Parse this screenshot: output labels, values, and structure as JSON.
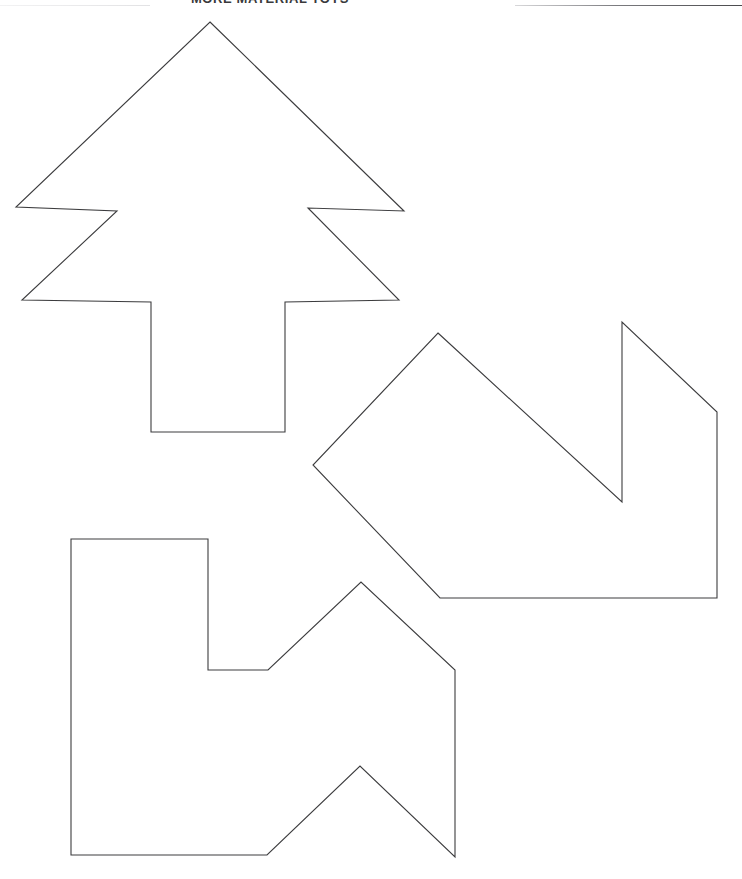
{
  "page": {
    "width": 742,
    "height": 879,
    "background_color": "#ffffff",
    "document_type": "printable cut-out shape templates worksheet"
  },
  "header": {
    "title": "MORE MATERIAL TOYS",
    "title_color": "#3a3a3c",
    "rule_color": "#4a4a4d",
    "clipped": "top of heading cut off by page crop"
  },
  "drawing": {
    "stroke_color": "#3c3c3e",
    "fill_color": "#ffffff",
    "stroke_width": 1.1,
    "shape_count": 3,
    "shapes": [
      {
        "id": "shape-tree",
        "name": "christmas-tree-template",
        "label": "Christmas tree cut-out outline",
        "points": "210,22 404,211 308,208 399,300 285,302 285,432 151,432 151,302 22,300 117,211 16,207",
        "bbox": {
          "x": 16,
          "y": 22,
          "width": 388,
          "height": 410
        }
      },
      {
        "id": "shape-chevron",
        "name": "notched-chevron-template",
        "label": "Notched chevron / arrow cut-out outline",
        "points": "438,333 622,502 622,322 717,412 717,598 440,598 313,465",
        "bbox": {
          "x": 313,
          "y": 322,
          "width": 404,
          "height": 276
        }
      },
      {
        "id": "shape-stepped",
        "name": "stepped-peaked-template",
        "label": "Stepped double-peak cut-out outline",
        "points": "71,539 208,539 208,670 268,670 361,582 455,670 455,857 360,766 267,855 71,855",
        "bbox": {
          "x": 71,
          "y": 539,
          "width": 384,
          "height": 318
        }
      }
    ]
  }
}
